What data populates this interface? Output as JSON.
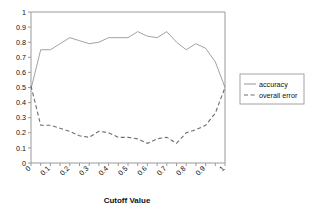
{
  "chart_data": {
    "type": "line",
    "title": "",
    "xlabel": "Cutoff Value",
    "ylabel": "",
    "xlim": [
      0,
      1
    ],
    "ylim": [
      0,
      1
    ],
    "grid": false,
    "legend_position": "right",
    "x": [
      0,
      0.05,
      0.1,
      0.15,
      0.2,
      0.25,
      0.3,
      0.35,
      0.4,
      0.45,
      0.5,
      0.55,
      0.6,
      0.65,
      0.7,
      0.75,
      0.8,
      0.85,
      0.9,
      0.95,
      1
    ],
    "xtick_labels": [
      "0",
      "0.1",
      "0.2",
      "0.3",
      "0.4",
      "0.5",
      "0.6",
      "0.7",
      "0.8",
      "0.9",
      "1"
    ],
    "xtick_values": [
      0,
      0.1,
      0.2,
      0.3,
      0.4,
      0.5,
      0.6,
      0.7,
      0.8,
      0.9,
      1
    ],
    "ytick_labels": [
      "0",
      "0.1",
      "0.2",
      "0.3",
      "0.4",
      "0.5",
      "0.6",
      "0.7",
      "0.8",
      "0.9",
      "1"
    ],
    "ytick_values": [
      0,
      0.1,
      0.2,
      0.3,
      0.4,
      0.5,
      0.6,
      0.7,
      0.8,
      0.9,
      1
    ],
    "series": [
      {
        "name": "accuracy",
        "style": "solid",
        "color": "#8a8a8a",
        "values": [
          0.49,
          0.75,
          0.75,
          0.79,
          0.83,
          0.81,
          0.79,
          0.8,
          0.83,
          0.83,
          0.83,
          0.87,
          0.84,
          0.83,
          0.87,
          0.8,
          0.75,
          0.79,
          0.76,
          0.67,
          0.5
        ]
      },
      {
        "name": "overall error",
        "style": "dashed",
        "color": "#6e6e6e",
        "values": [
          0.51,
          0.25,
          0.25,
          0.23,
          0.21,
          0.18,
          0.17,
          0.21,
          0.2,
          0.17,
          0.17,
          0.16,
          0.13,
          0.16,
          0.17,
          0.13,
          0.2,
          0.22,
          0.25,
          0.33,
          0.5
        ]
      }
    ]
  },
  "legend": {
    "items": [
      {
        "label": "accuracy",
        "style": "solid"
      },
      {
        "label": "overall error",
        "style": "dashed"
      }
    ]
  },
  "axis": {
    "x_title": "Cutoff Value"
  }
}
